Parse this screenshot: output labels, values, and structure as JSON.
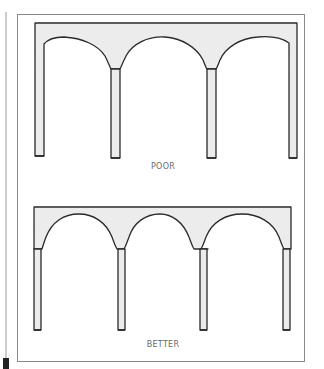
{
  "figure": {
    "colors": {
      "background": "#ffffff",
      "frame": "#8a8a8a",
      "margin_line": "#9a9a9a",
      "structure_stroke": "#2a2a2a",
      "structure_fill": "#ececec",
      "label_text": "#6a6a6a",
      "marker": "#222222"
    },
    "panels": [
      {
        "id": "poor",
        "label": "POOR",
        "description": "Arcade with thin columns and wide, flattened arches flaring into narrow necks"
      },
      {
        "id": "better",
        "label": "BETTER",
        "description": "Arcade with evenly spaced columns and semicircular arches"
      }
    ]
  }
}
